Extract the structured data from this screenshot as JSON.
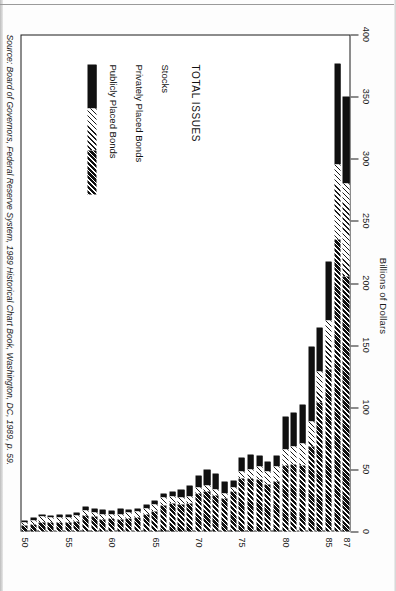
{
  "axis": {
    "value_axis_title": "Billions of Dollars",
    "value_ticks": [
      "0",
      "50",
      "100",
      "150",
      "200",
      "250",
      "300",
      "350",
      "400"
    ],
    "year_ticks": [
      "50",
      "55",
      "60",
      "65",
      "70",
      "75",
      "80",
      "85",
      "87"
    ]
  },
  "legend": {
    "title": "TOTAL ISSUES",
    "items": [
      {
        "label": "Stocks",
        "swatch": "solid-black"
      },
      {
        "label": "Privately Placed Bonds",
        "swatch": "light-diagonal-hatch"
      },
      {
        "label": "Publicly Placed Bonds",
        "swatch": "dense-diagonal-hatch"
      }
    ]
  },
  "source": "Source: Board of Governors, Federal Reserve System, 1989 Historical Chart Book, Washington, DC, 1989, p. 59.",
  "chart_data": {
    "type": "bar",
    "orientation": "horizontal-stacked",
    "title": "",
    "xlabel": "Billions of Dollars",
    "ylabel": "",
    "xlim": [
      0,
      400
    ],
    "grid": false,
    "legend_position": "inside-lower-left",
    "categories": [
      "1950",
      "1951",
      "1952",
      "1953",
      "1954",
      "1955",
      "1956",
      "1957",
      "1958",
      "1959",
      "1960",
      "1961",
      "1962",
      "1963",
      "1964",
      "1965",
      "1966",
      "1967",
      "1968",
      "1969",
      "1970",
      "1971",
      "1972",
      "1973",
      "1974",
      "1975",
      "1976",
      "1977",
      "1978",
      "1979",
      "1980",
      "1981",
      "1982",
      "1983",
      "1984",
      "1985",
      "1986",
      "1987"
    ],
    "series": [
      {
        "name": "Publicly Placed Bonds",
        "values": [
          4.9,
          5.7,
          7.6,
          7.1,
          7.5,
          7.4,
          8.0,
          12.9,
          12.0,
          9.7,
          10.2,
          9.4,
          10.6,
          10.9,
          13.9,
          15.8,
          21.0,
          22.3,
          21.5,
          22.5,
          30.3,
          32.1,
          28.9,
          26.6,
          32.1,
          42.8,
          42.3,
          42.0,
          38.0,
          40.2,
          53.2,
          53.8,
          53.5,
          68.6,
          104.0,
          130.0,
          235.0,
          205.0
        ]
      },
      {
        "name": "Privately Placed Bonds",
        "values": [
          2.6,
          3.2,
          4.2,
          3.9,
          4.0,
          4.1,
          4.5,
          3.8,
          3.3,
          3.6,
          3.3,
          3.9,
          4.5,
          5.1,
          4.7,
          5.7,
          6.7,
          6.2,
          5.9,
          5.3,
          5.2,
          4.7,
          4.9,
          4.3,
          3.6,
          5.5,
          8.0,
          10.0,
          10.0,
          12.0,
          13.0,
          15.0,
          17.0,
          20.0,
          25.0,
          40.0,
          60.0,
          75.0
        ]
      },
      {
        "name": "Stocks",
        "values": [
          1.1,
          2.0,
          2.2,
          2.1,
          2.2,
          2.6,
          3.1,
          3.3,
          3.6,
          4.3,
          3.1,
          5.1,
          2.4,
          2.4,
          3.2,
          3.6,
          3.1,
          4.1,
          6.1,
          9.0,
          9.5,
          13.4,
          13.3,
          9.5,
          5.0,
          11.0,
          12.0,
          9.0,
          8.0,
          9.0,
          26.0,
          27.0,
          32.0,
          60.0,
          35.0,
          47.0,
          82.0,
          70.0
        ]
      }
    ]
  }
}
